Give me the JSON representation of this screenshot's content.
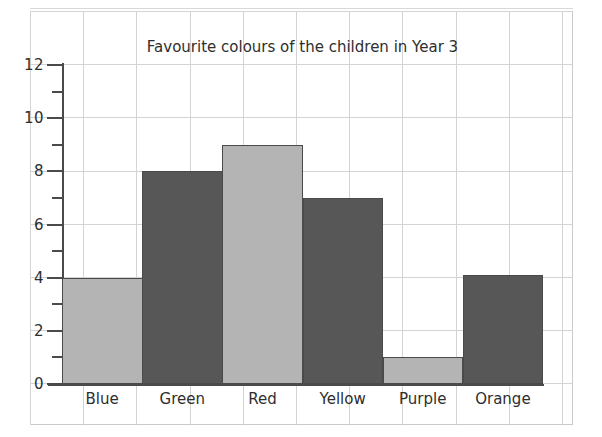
{
  "chart_data": {
    "type": "bar",
    "title": "Favourite colours of the children in Year 3",
    "xlabel": "",
    "ylabel": "",
    "categories": [
      "Blue",
      "Green",
      "Red",
      "Yellow",
      "Purple",
      "Orange"
    ],
    "values": [
      4,
      8,
      9,
      7,
      1,
      4.1
    ],
    "series": [
      {
        "name": "Number of children",
        "values": [
          4,
          8,
          9,
          7,
          1,
          4.1
        ]
      }
    ],
    "bar_colors": [
      "#b4b4b4",
      "#575757",
      "#b4b4b4",
      "#575757",
      "#b4b4b4",
      "#575757"
    ],
    "bar_border_color": "#4a4a4a",
    "ylim": [
      0,
      12
    ],
    "major_ticks": [
      0,
      2,
      4,
      6,
      8,
      10,
      12
    ],
    "minor_ticks": [
      1,
      3,
      5,
      7,
      9,
      11
    ],
    "ytick_labels": [
      "0",
      "2",
      "4",
      "6",
      "8",
      "10",
      "12"
    ],
    "grid": true,
    "grid_color": "#d3d3d3",
    "legend": null,
    "legend_position": "none",
    "axis_color": "#4a4a4a",
    "background": "#ffffff"
  }
}
